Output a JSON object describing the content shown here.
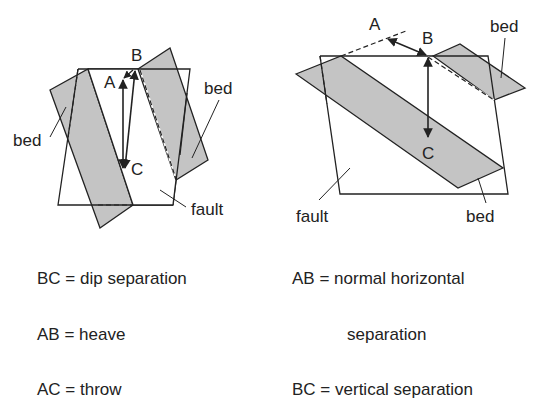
{
  "left_diagram": {
    "points": {
      "A": "A",
      "B": "B",
      "C": "C"
    },
    "labels": {
      "bed_left": "bed",
      "bed_right": "bed",
      "fault": "fault"
    },
    "legend": [
      {
        "key": "BC",
        "eq": "=",
        "text": "dip separation"
      },
      {
        "key": "AB",
        "eq": "=",
        "text": "heave"
      },
      {
        "key": "AC",
        "eq": "=",
        "text": "throw"
      }
    ]
  },
  "right_diagram": {
    "points": {
      "A": "A",
      "B": "B",
      "C": "C"
    },
    "labels": {
      "bed_top": "bed",
      "bed_bottom": "bed",
      "fault": "fault"
    },
    "legend": [
      {
        "key": "AB",
        "eq": "=",
        "text": "normal horizontal"
      },
      {
        "key": "",
        "eq": "",
        "text": "separation"
      },
      {
        "key": "BC",
        "eq": "=",
        "text": "vertical separation"
      }
    ]
  },
  "colors": {
    "bed_fill": "#c4c4c4",
    "line": "#222222",
    "background": "#ffffff"
  }
}
